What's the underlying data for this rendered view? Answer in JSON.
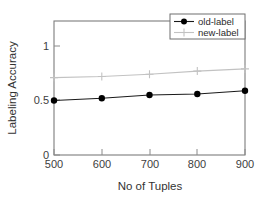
{
  "chart_data": {
    "type": "line",
    "title": "",
    "xlabel": "No of Tuples",
    "ylabel": "Labeling Accuracy",
    "x": [
      500,
      600,
      700,
      800,
      900
    ],
    "xticklabels": [
      "500",
      "600",
      "700",
      "800",
      "900"
    ],
    "yticks": [
      0,
      0.5,
      1
    ],
    "yticklabels": [
      "0",
      "0.5",
      "1"
    ],
    "xlim": [
      500,
      900
    ],
    "ylim": [
      0,
      1.16
    ],
    "grid": false,
    "legend_position": "top-right",
    "series": [
      {
        "name": "old-label",
        "color": "#000000",
        "marker": "filled-circle",
        "values": [
          0.5,
          0.52,
          0.55,
          0.56,
          0.59
        ]
      },
      {
        "name": "new-label",
        "color": "#c2c2c2",
        "marker": "plus",
        "values": [
          0.71,
          0.72,
          0.74,
          0.77,
          0.79
        ]
      }
    ]
  },
  "axes": {
    "x_title": "No of Tuples",
    "y_title": "Labeling Accuracy",
    "x_ticks": [
      "500",
      "600",
      "700",
      "800",
      "900"
    ],
    "y_ticks": [
      "1",
      "0.5",
      "0"
    ]
  },
  "legend": {
    "entries": [
      {
        "label": "old-label"
      },
      {
        "label": "new-label"
      }
    ]
  }
}
